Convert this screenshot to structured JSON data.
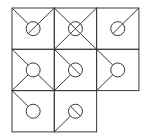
{
  "diagram": {
    "type": "tile-puzzle-grid",
    "grid": {
      "rows": 3,
      "cols": 3,
      "origin_x": 12,
      "origin_y": 8,
      "cell_w": 42.3,
      "cell_h": 41.3
    },
    "stroke_color": "#3a3a3a",
    "background_color": "#ffffff",
    "circle_radius": 7,
    "tiles": [
      {
        "row": 0,
        "col": 0,
        "lines": [
          "tl",
          "tr"
        ],
        "inner": "slash-rl"
      },
      {
        "row": 0,
        "col": 1,
        "lines": [
          "tl",
          "tr",
          "bl",
          "br"
        ],
        "inner": "cross"
      },
      {
        "row": 0,
        "col": 2,
        "lines": [
          "tr"
        ],
        "inner": "slash-rl"
      },
      {
        "row": 1,
        "col": 0,
        "lines": [
          "tl",
          "bl",
          "br"
        ],
        "inner": "none"
      },
      {
        "row": 1,
        "col": 1,
        "lines": [
          "tl",
          "bl"
        ],
        "inner": "slash-lr"
      },
      {
        "row": 1,
        "col": 2,
        "lines": [
          "tl",
          "bl"
        ],
        "inner": "none"
      },
      {
        "row": 2,
        "col": 0,
        "lines": [
          "tl"
        ],
        "inner": "none"
      },
      {
        "row": 2,
        "col": 1,
        "lines": [
          "bl"
        ],
        "inner": "slash-lr"
      }
    ]
  }
}
